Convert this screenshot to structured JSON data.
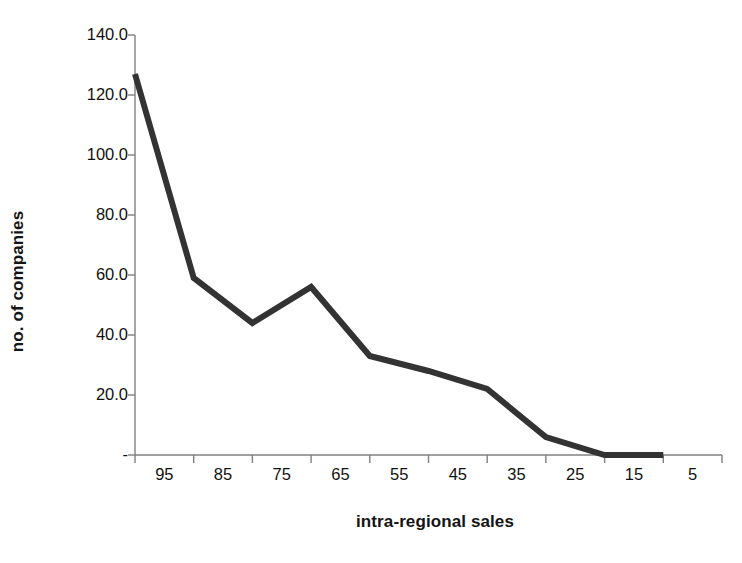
{
  "chart_data": {
    "type": "line",
    "title": "",
    "xlabel": "intra-regional sales",
    "ylabel": "no. of companies",
    "categories": [
      "95",
      "85",
      "75",
      "65",
      "55",
      "45",
      "35",
      "25",
      "15",
      "5"
    ],
    "values": [
      127,
      59,
      44,
      56,
      33,
      28,
      22,
      6,
      0,
      0
    ],
    "series": [
      {
        "name": "no. of companies",
        "values": [
          127,
          59,
          44,
          56,
          33,
          28,
          22,
          6,
          0,
          0
        ]
      }
    ],
    "ylim": [
      0,
      140
    ],
    "ytick_values": [
      0,
      20,
      40,
      60,
      80,
      100,
      120,
      140
    ],
    "ytick_labels": [
      "-",
      "20.0",
      "40.0",
      "60.0",
      "80.0",
      "100.0",
      "120.0",
      "140.0"
    ],
    "xtick_labels": [
      "95",
      "85",
      "75",
      "65",
      "55",
      "45",
      "35",
      "25",
      "15",
      "5"
    ],
    "grid": false,
    "legend": false,
    "legend_position": "none",
    "line_color": "#333333",
    "line_width": 6,
    "markers": false,
    "background_color": "#ffffff",
    "axis_color": "#808080",
    "text_color": "#111111",
    "annotations": []
  },
  "axis_titles": {
    "x": "intra-regional sales",
    "y": "no. of companies"
  }
}
